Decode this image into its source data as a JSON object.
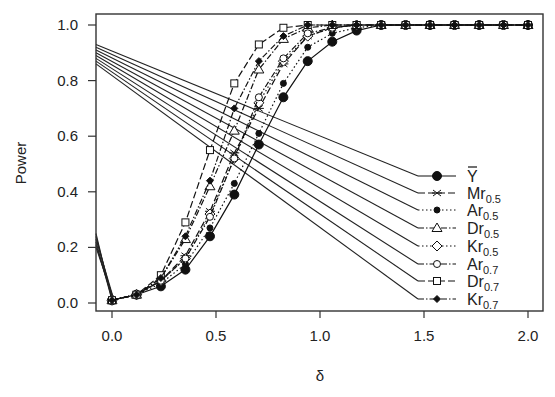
{
  "chart_data": {
    "type": "line",
    "title": "",
    "xlabel": "δ",
    "ylabel": "Power",
    "xlim": [
      -0.08,
      2.08
    ],
    "ylim": [
      -0.03,
      1.04
    ],
    "grid": false,
    "legend_position": "right-center (inside)",
    "x_ticks": [
      "0.0",
      "0.5",
      "1.0",
      "1.5",
      "2.0"
    ],
    "y_ticks": [
      "0.0",
      "0.2",
      "0.4",
      "0.6",
      "0.8",
      "1.0"
    ],
    "x": [
      0.0,
      0.118,
      0.235,
      0.353,
      0.471,
      0.588,
      0.706,
      0.824,
      0.941,
      1.059,
      1.176,
      1.294,
      1.412,
      1.529,
      1.647,
      1.765,
      1.882,
      2.0
    ],
    "series": [
      {
        "name": "Ȳ",
        "label_main": "Y",
        "label_sub": "",
        "overbar": true,
        "marker": "filled-circle-large",
        "dash": "solid",
        "values": [
          0.01,
          0.03,
          0.06,
          0.12,
          0.24,
          0.39,
          0.57,
          0.74,
          0.87,
          0.94,
          0.98,
          1.0,
          1.0,
          1.0,
          1.0,
          1.0,
          1.0,
          1.0
        ]
      },
      {
        "name": "Mr0.5",
        "label_main": "Mr",
        "label_sub": "0.5",
        "marker": "star",
        "dash": "longdash",
        "values": [
          0.01,
          0.03,
          0.08,
          0.17,
          0.33,
          0.54,
          0.7,
          0.86,
          0.96,
          0.99,
          1.0,
          1.0,
          1.0,
          1.0,
          1.0,
          1.0,
          1.0,
          1.0
        ]
      },
      {
        "name": "Ar0.5",
        "label_main": "Ar",
        "label_sub": "0.5",
        "marker": "filled-circle-small",
        "dash": "dotted",
        "values": [
          0.01,
          0.03,
          0.07,
          0.14,
          0.27,
          0.43,
          0.61,
          0.79,
          0.92,
          0.97,
          0.99,
          1.0,
          1.0,
          1.0,
          1.0,
          1.0,
          1.0,
          1.0
        ]
      },
      {
        "name": "Dr0.5",
        "label_main": "Dr",
        "label_sub": "0.5",
        "marker": "triangle",
        "dash": "dashdot",
        "values": [
          0.01,
          0.03,
          0.09,
          0.23,
          0.42,
          0.62,
          0.84,
          0.95,
          0.99,
          1.0,
          1.0,
          1.0,
          1.0,
          1.0,
          1.0,
          1.0,
          1.0,
          1.0
        ]
      },
      {
        "name": "Kr0.5",
        "label_main": "Kr",
        "label_sub": "0.5",
        "marker": "diamond",
        "dash": "dotted",
        "values": [
          0.01,
          0.03,
          0.08,
          0.16,
          0.32,
          0.52,
          0.72,
          0.87,
          0.96,
          0.99,
          1.0,
          1.0,
          1.0,
          1.0,
          1.0,
          1.0,
          1.0,
          1.0
        ]
      },
      {
        "name": "Ar0.7",
        "label_main": "Ar",
        "label_sub": "0.7",
        "marker": "open-circle",
        "dash": "dashdot",
        "values": [
          0.01,
          0.03,
          0.08,
          0.16,
          0.31,
          0.52,
          0.74,
          0.88,
          0.97,
          0.99,
          1.0,
          1.0,
          1.0,
          1.0,
          1.0,
          1.0,
          1.0,
          1.0
        ]
      },
      {
        "name": "Dr0.7",
        "label_main": "Dr",
        "label_sub": "0.7",
        "marker": "square",
        "dash": "longdash",
        "values": [
          0.01,
          0.03,
          0.1,
          0.29,
          0.55,
          0.79,
          0.93,
          0.99,
          1.0,
          1.0,
          1.0,
          1.0,
          1.0,
          1.0,
          1.0,
          1.0,
          1.0,
          1.0
        ]
      },
      {
        "name": "Kr0.7",
        "label_main": "Kr",
        "label_sub": "0.7",
        "marker": "filled-diamond-small",
        "dash": "dashdot",
        "values": [
          0.01,
          0.03,
          0.09,
          0.24,
          0.44,
          0.7,
          0.87,
          0.96,
          1.0,
          1.0,
          1.0,
          1.0,
          1.0,
          1.0,
          1.0,
          1.0,
          1.0,
          1.0
        ]
      }
    ],
    "legend_connectors": {
      "description": "straight solid lines from left axis to each legend entry",
      "left_starts_upper": [
        0.93,
        0.92,
        0.91,
        0.9,
        0.89,
        0.88,
        0.87,
        0.86
      ],
      "left_starts_lower": [
        0.25,
        0.24,
        0.23,
        0.22,
        0.21,
        0.2
      ]
    }
  }
}
